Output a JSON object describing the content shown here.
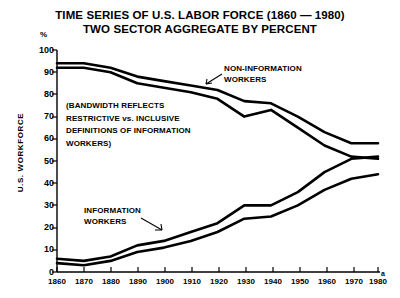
{
  "chart_data": {
    "type": "line",
    "title": "TIME SERIES OF U.S. LABOR FORCE (1860 — 1980)",
    "subtitle": "TWO SECTOR AGGREGATE BY PERCENT",
    "xlabel": "",
    "ylabel": "U.S. WORKFORCE",
    "y_unit": "%",
    "xlim": [
      1860,
      1980
    ],
    "ylim": [
      0,
      100
    ],
    "grid": false,
    "legend": "none",
    "x_ticks": [
      1860,
      1870,
      1880,
      1890,
      1900,
      1910,
      1920,
      1930,
      1940,
      1950,
      1960,
      1970,
      1980
    ],
    "y_ticks": [
      0,
      10,
      20,
      30,
      40,
      50,
      60,
      70,
      80,
      90,
      100
    ],
    "x": [
      1860,
      1870,
      1880,
      1890,
      1900,
      1910,
      1920,
      1930,
      1940,
      1950,
      1960,
      1970,
      1980
    ],
    "series": [
      {
        "name": "NON-INFORMATION WORKERS (inclusive upper bound)",
        "band": "upper",
        "values": [
          94,
          94,
          92,
          88,
          86,
          84,
          82,
          77,
          76,
          70,
          63,
          58,
          58
        ]
      },
      {
        "name": "NON-INFORMATION WORKERS (restrictive lower bound)",
        "band": "upper",
        "values": [
          92,
          92,
          90,
          85,
          83,
          81,
          78,
          70,
          73,
          65,
          57,
          52,
          51
        ]
      },
      {
        "name": "INFORMATION WORKERS (inclusive upper bound)",
        "band": "lower",
        "values": [
          6,
          5,
          7,
          12,
          14,
          18,
          22,
          30,
          30,
          36,
          45,
          51,
          52
        ]
      },
      {
        "name": "INFORMATION WORKERS (restrictive lower bound)",
        "band": "lower",
        "values": [
          4,
          3,
          5,
          9,
          11,
          14,
          18,
          24,
          25,
          30,
          37,
          42,
          44
        ]
      }
    ],
    "annotations": [
      {
        "name": "bandwidth-note",
        "lines": [
          "(BANDWIDTH REFLECTS",
          "RESTRICTIVE vs. INCLUSIVE",
          "DEFINITIONS OF INFORMATION",
          "WORKERS)"
        ]
      },
      {
        "name": "non-information-label",
        "lines": [
          "NON-INFORMATION",
          "WORKERS"
        ]
      },
      {
        "name": "information-label",
        "lines": [
          "INFORMATION",
          "WORKERS"
        ]
      }
    ],
    "footnote_marker": "a",
    "colors": {
      "line": "#000000",
      "background": "#ffffff",
      "text": "#000000"
    }
  },
  "ticks": {
    "y": [
      "100",
      "90",
      "80",
      "70",
      "60",
      "50",
      "40",
      "30",
      "20",
      "10",
      "0"
    ],
    "x": [
      "1860",
      "1870",
      "1880",
      "1890",
      "1900",
      "1910",
      "1920",
      "1930",
      "1940",
      "1950",
      "1960",
      "1970",
      "1980"
    ]
  },
  "labels": {
    "percent_symbol": "%",
    "y_axis_title": "U.S. WORKFORCE",
    "footnote_marker": "a"
  },
  "annotations": {
    "bandwidth": {
      "l1": "(BANDWIDTH REFLECTS",
      "l2": "RESTRICTIVE vs. INCLUSIVE",
      "l3": "DEFINITIONS OF INFORMATION",
      "l4": "WORKERS)"
    },
    "noninfo": {
      "l1": "NON-INFORMATION",
      "l2": "WORKERS"
    },
    "info": {
      "l1": "INFORMATION",
      "l2": "WORKERS"
    }
  },
  "title": {
    "line1": "TIME SERIES OF U.S. LABOR FORCE (1860 — 1980)",
    "line2": "TWO SECTOR AGGREGATE BY PERCENT"
  }
}
